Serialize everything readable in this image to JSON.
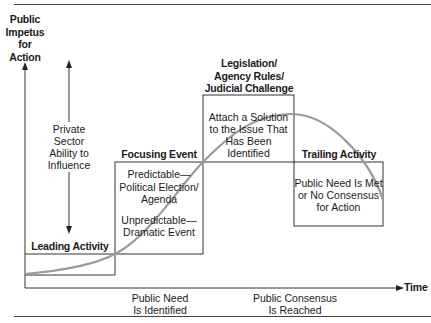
{
  "diagram": {
    "y_axis_label": [
      "Public",
      "Impetus",
      "for",
      "Action"
    ],
    "x_axis_label": "Time",
    "private_sector": {
      "lines": [
        "Private",
        "Sector",
        "Ability to",
        "Influence"
      ]
    },
    "stages": [
      {
        "title": "Leading Activity",
        "lines": []
      },
      {
        "title": "Focusing Event",
        "lines": [
          "Predictable—",
          "Political Election/",
          "Agenda",
          "",
          "Unpredictable—",
          "Dramatic Event"
        ]
      },
      {
        "title_lines": [
          "Legislation/",
          "Agency Rules/",
          "Judicial Challenge"
        ],
        "lines": [
          "Attach a Solution",
          "to the Issue That",
          "Has Been Identified"
        ]
      },
      {
        "title": "Trailing Activity",
        "lines": [
          "Public Need Is Met",
          "or No Consensus",
          "for Action"
        ]
      }
    ],
    "milestones": [
      {
        "lines": [
          "Public Need",
          "Is Identified"
        ]
      },
      {
        "lines": [
          "Public Consensus",
          "Is Reached"
        ]
      }
    ],
    "colors": {
      "line": "#333333",
      "curve": "#9a9a9a",
      "background": "#ffffff"
    }
  }
}
